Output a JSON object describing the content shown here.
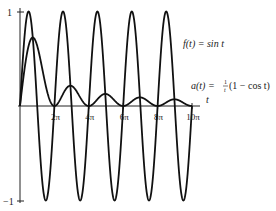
{
  "chart_data": {
    "type": "line",
    "title": "",
    "xlabel": "t",
    "ylabel": "",
    "xlim": [
      0,
      31.4159
    ],
    "ylim": [
      -1,
      1
    ],
    "x_ticks": [
      "2π",
      "4π",
      "6π",
      "8π",
      "10π"
    ],
    "x_tick_values": [
      6.2832,
      12.5664,
      18.8496,
      25.1327,
      31.4159
    ],
    "y_ticks": [
      "1",
      "−1"
    ],
    "y_tick_values": [
      1,
      -1
    ],
    "grid": false,
    "legend": "none (inline annotations)",
    "series": [
      {
        "name": "f(t) = sin t",
        "formula": "sin(t)",
        "sample_x": [
          0,
          1.5708,
          3.1416,
          4.7124,
          6.2832,
          7.854,
          9.4248,
          10.9956,
          12.5664
        ],
        "sample_y": [
          0,
          1,
          0,
          -1,
          0,
          1,
          0,
          -1,
          0
        ]
      },
      {
        "name": "a(t) = (1/t)(1 − cos t)",
        "formula": "(1 - cos(t)) / t",
        "sample_x": [
          0,
          2.33,
          6.2832,
          8.99,
          12.5664,
          15.45,
          18.8496,
          21.85,
          25.1327,
          28.2,
          31.4159
        ],
        "sample_y": [
          0,
          0.725,
          0,
          0.217,
          0,
          0.129,
          0,
          0.092,
          0,
          0.071,
          0
        ]
      }
    ],
    "annotations": {
      "f_label": "f(t) = sin t",
      "a_label_prefix": "a(t) = ",
      "a_label_frac_num": "1",
      "a_label_frac_den": "t",
      "a_label_suffix": "(1 − cos t)"
    }
  },
  "axes": {
    "t_label": "t",
    "y_top": "1",
    "y_bottom": "−1",
    "ticks": [
      "2π",
      "4π",
      "6π",
      "8π",
      "10π"
    ]
  },
  "colors": {
    "curve": "#111111",
    "axis": "#222222",
    "background": "#ffffff"
  }
}
